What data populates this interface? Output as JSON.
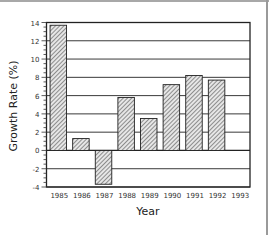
{
  "chart_data": {
    "type": "bar",
    "title": "",
    "xlabel": "Year",
    "ylabel": "Growth Rate (%)",
    "categories": [
      "1985",
      "1986",
      "1987",
      "1988",
      "1989",
      "1990",
      "1991",
      "1992",
      "1993"
    ],
    "values": [
      13.7,
      1.3,
      -3.7,
      5.8,
      3.5,
      7.2,
      8.2,
      7.7,
      null
    ],
    "ylim": [
      -4,
      14
    ],
    "yticks": [
      14,
      12,
      10,
      8,
      6,
      4,
      2,
      0,
      -2,
      -4
    ],
    "ytick_labels": [
      "14",
      "12",
      "10",
      "8",
      "6",
      "4",
      "2",
      "0",
      "-2",
      "-4"
    ],
    "grid": true,
    "legend": "none",
    "bar_fill": "hatched-diagonal",
    "colors": {
      "bar_stroke": "#222222",
      "hatch": "#555555",
      "bar_bg": "#d8d8d8",
      "grid": "#222222"
    }
  }
}
